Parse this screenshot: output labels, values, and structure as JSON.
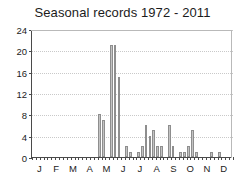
{
  "chart_data": {
    "type": "bar",
    "title": "Seasonal records 1972 - 2011",
    "xlabel": "",
    "ylabel": "",
    "ylim": [
      0,
      24
    ],
    "yticks": [
      0,
      4,
      8,
      12,
      16,
      20,
      24
    ],
    "ytick_labels": [
      "0",
      "4",
      "8",
      "12",
      "16",
      "20",
      "24"
    ],
    "grid": true,
    "grid_axis": "y",
    "legend": "none",
    "xtick_labels": [
      "J",
      "F",
      "M",
      "A",
      "M",
      "J",
      "J",
      "A",
      "S",
      "O",
      "N",
      "D"
    ],
    "xtick_names": [
      "January",
      "February",
      "March",
      "April",
      "May",
      "June",
      "July",
      "August",
      "September",
      "October",
      "November",
      "December"
    ],
    "bin": "week",
    "n_bins": 52,
    "categories": [
      1,
      2,
      3,
      4,
      5,
      6,
      7,
      8,
      9,
      10,
      11,
      12,
      13,
      14,
      15,
      16,
      17,
      18,
      19,
      20,
      21,
      22,
      23,
      24,
      25,
      26,
      27,
      28,
      29,
      30,
      31,
      32,
      33,
      34,
      35,
      36,
      37,
      38,
      39,
      40,
      41,
      42,
      43,
      44,
      45,
      46,
      47,
      48,
      49,
      50,
      51,
      52
    ],
    "values": [
      0,
      0,
      0,
      0,
      0,
      0,
      0,
      0,
      0,
      0,
      0,
      0,
      0,
      0,
      0,
      0,
      0,
      8,
      7,
      0,
      21,
      21,
      15,
      0,
      2,
      1,
      0,
      1,
      2,
      6,
      4,
      5,
      2,
      2,
      0,
      6,
      2,
      0,
      1,
      1,
      2,
      5,
      1,
      0,
      0,
      0,
      1,
      0,
      1,
      0,
      0,
      0
    ],
    "bar_color": "#c3c3c3",
    "bar_edge_color": "#8e8e8e",
    "axis_color": "#4a4a4a",
    "grid_color": "#c9c9c9",
    "background_color": "#ffffff",
    "max_value": 21,
    "peak_month": "May"
  }
}
